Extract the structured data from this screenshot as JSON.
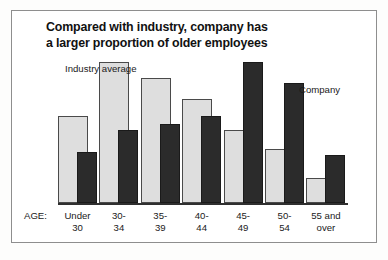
{
  "chart_data": {
    "type": "bar",
    "title": "Compared with industry, company has a larger proportion of older employees",
    "title_lines": [
      "Compared with industry, company has",
      "a larger proportion of older employees"
    ],
    "xlabel": "AGE:",
    "ylabel": "",
    "grid": false,
    "legend_position": "inline-callouts",
    "categories": [
      "Under 30",
      "30-34",
      "35-39",
      "40-44",
      "45-49",
      "50-54",
      "55 and over"
    ],
    "category_lines": [
      [
        "Under",
        "30"
      ],
      [
        "30-",
        "34"
      ],
      [
        "35-",
        "39"
      ],
      [
        "40-",
        "44"
      ],
      [
        "45-",
        "49"
      ],
      [
        "50-",
        "54"
      ],
      [
        "55 and",
        "over"
      ]
    ],
    "series": [
      {
        "name": "Industry average",
        "color": "#dedede",
        "values": [
          62,
          100,
          89,
          74,
          52,
          38,
          18
        ]
      },
      {
        "name": "Company",
        "color": "#2b2b2b",
        "values": [
          36,
          52,
          56,
          62,
          100,
          85,
          34
        ]
      }
    ],
    "ylim": [
      0,
      100
    ],
    "value_units": "relative percent of maximum"
  },
  "annotations": {
    "industry_label_lines": [
      "Industry",
      "average"
    ],
    "company_label": "Company",
    "age_prefix": "AGE:"
  },
  "colors": {
    "industry_fill": "#dedede",
    "industry_stroke": "#4a4a4a",
    "company_fill": "#2b2b2b",
    "company_stroke": "#1a1a1a",
    "axis": "#2f2f2f",
    "frame": "#8e8e8e",
    "text": "#1a1a1a",
    "page": "#ffffff"
  }
}
